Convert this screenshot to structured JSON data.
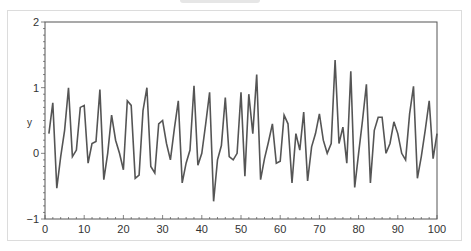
{
  "chart_data": {
    "type": "line",
    "title": "",
    "xlabel": "",
    "ylabel": "y",
    "xlim": [
      0,
      100
    ],
    "ylim": [
      -1,
      2
    ],
    "xticks": [
      0,
      10,
      20,
      30,
      40,
      50,
      60,
      70,
      80,
      90,
      100
    ],
    "xtick_labels": [
      "0",
      "10",
      "20",
      "30",
      "40",
      "50",
      "60",
      "70",
      "80",
      "90",
      "100"
    ],
    "yticks": [
      -1,
      0,
      1,
      2
    ],
    "ytick_labels": [
      "−1",
      "0",
      "1",
      "2"
    ],
    "grid": false,
    "legend": null,
    "line_color": "#555555",
    "series": [
      {
        "name": "y",
        "x": [
          1,
          2,
          3,
          4,
          5,
          6,
          7,
          8,
          9,
          10,
          11,
          12,
          13,
          14,
          15,
          16,
          17,
          18,
          19,
          20,
          21,
          22,
          23,
          24,
          25,
          26,
          27,
          28,
          29,
          30,
          31,
          32,
          33,
          34,
          35,
          36,
          37,
          38,
          39,
          40,
          41,
          42,
          43,
          44,
          45,
          46,
          47,
          48,
          49,
          50,
          51,
          52,
          53,
          54,
          55,
          56,
          57,
          58,
          59,
          60,
          61,
          62,
          63,
          64,
          65,
          66,
          67,
          68,
          69,
          70,
          71,
          72,
          73,
          74,
          75,
          76,
          77,
          78,
          79,
          80,
          81,
          82,
          83,
          84,
          85,
          86,
          87,
          88,
          89,
          90,
          91,
          92,
          93,
          94,
          95,
          96,
          97,
          98,
          99,
          100
        ],
        "values": [
          0.3,
          0.77,
          -0.53,
          -0.05,
          0.35,
          1.0,
          -0.05,
          0.05,
          0.7,
          0.73,
          -0.15,
          0.15,
          0.18,
          0.97,
          -0.4,
          0.0,
          0.58,
          0.2,
          0.0,
          -0.25,
          0.8,
          0.73,
          -0.38,
          -0.33,
          0.65,
          1.0,
          -0.2,
          -0.3,
          0.45,
          0.5,
          0.15,
          -0.1,
          0.38,
          0.8,
          -0.45,
          -0.15,
          0.05,
          1.03,
          -0.18,
          0.0,
          0.45,
          0.93,
          -0.73,
          -0.1,
          0.12,
          0.85,
          -0.05,
          -0.1,
          0.0,
          0.93,
          -0.35,
          0.9,
          0.3,
          1.2,
          -0.4,
          -0.08,
          0.17,
          0.45,
          -0.15,
          -0.12,
          0.58,
          0.45,
          -0.45,
          0.3,
          0.05,
          0.63,
          -0.42,
          0.1,
          0.3,
          0.6,
          0.2,
          0.0,
          0.15,
          1.42,
          0.15,
          0.4,
          -0.15,
          1.25,
          -0.52,
          0.0,
          0.5,
          1.05,
          -0.45,
          0.35,
          0.55,
          0.55,
          0.0,
          0.15,
          0.48,
          0.3,
          0.0,
          -0.1,
          0.6,
          1.02,
          -0.38,
          -0.05,
          0.35,
          0.8,
          -0.08,
          0.3
        ]
      }
    ]
  }
}
